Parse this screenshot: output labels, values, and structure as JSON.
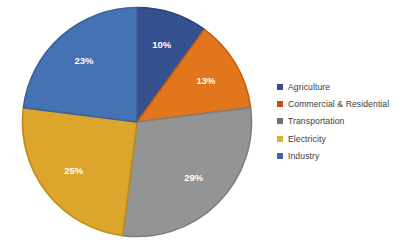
{
  "chart_data": {
    "type": "pie",
    "title": "",
    "subtitle": "",
    "xlabel": "",
    "ylabel": "",
    "legend_position": "right",
    "grid": false,
    "categories": [
      "Agriculture",
      "Commercial & Residential",
      "Transportation",
      "Electricity",
      "Industry"
    ],
    "values": [
      10,
      13,
      29,
      25,
      23
    ],
    "value_unit": "%",
    "data_labels": [
      "10%",
      "13%",
      "29%",
      "25%",
      "23%"
    ],
    "colors": [
      "#35508F",
      "#E2761C",
      "#949494",
      "#DCA52C",
      "#4472B4"
    ],
    "slice_border_colors": [
      "#2C4579",
      "#C25F12",
      "#7E7E7E",
      "#C08E17",
      "#3A619B"
    ],
    "start_angle_deg": 0,
    "direction": "clockwise",
    "slices": [
      {
        "label": "Agriculture",
        "value": 10,
        "data_label": "10%",
        "color": "#35508F"
      },
      {
        "label": "Commercial & Residential",
        "value": 13,
        "data_label": "13%",
        "color": "#E2761C"
      },
      {
        "label": "Transportation",
        "value": 29,
        "data_label": "29%",
        "color": "#949494"
      },
      {
        "label": "Electricity",
        "value": 25,
        "data_label": "25%",
        "color": "#DCA52C"
      },
      {
        "label": "Industry",
        "value": 23,
        "data_label": "23%",
        "color": "#4472B4"
      }
    ]
  },
  "legend": {
    "items": [
      {
        "label": "Agriculture",
        "color": "#35508F"
      },
      {
        "label": "Commercial & Residential",
        "color": "#C0541B"
      },
      {
        "label": "Transportation",
        "color": "#6E7177"
      },
      {
        "label": "Electricity",
        "color": "#D7B13E"
      },
      {
        "label": "Industry",
        "color": "#3D64A8"
      }
    ]
  }
}
